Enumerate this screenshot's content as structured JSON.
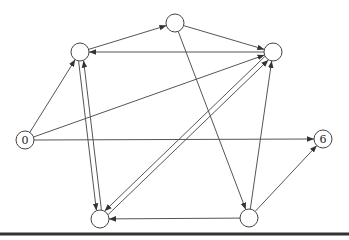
{
  "diagram": {
    "type": "directed-graph",
    "nodes": [
      {
        "id": "n0",
        "label": "0",
        "x": 25,
        "y": 140
      },
      {
        "id": "nL",
        "label": "",
        "x": 80,
        "y": 52
      },
      {
        "id": "nT",
        "label": "",
        "x": 175,
        "y": 23
      },
      {
        "id": "nR",
        "label": "",
        "x": 273,
        "y": 52
      },
      {
        "id": "n6",
        "label": "6",
        "x": 323,
        "y": 139
      },
      {
        "id": "nBL",
        "label": "",
        "x": 100,
        "y": 219
      },
      {
        "id": "nBR",
        "label": "",
        "x": 249,
        "y": 218
      }
    ],
    "edges": [
      {
        "from": "n0",
        "to": "nL"
      },
      {
        "from": "n0",
        "to": "nR"
      },
      {
        "from": "n0",
        "to": "n6"
      },
      {
        "from": "nL",
        "to": "nT"
      },
      {
        "from": "nR",
        "to": "nL"
      },
      {
        "from": "nL",
        "to": "nBL"
      },
      {
        "from": "nBL",
        "to": "nL"
      },
      {
        "from": "nT",
        "to": "nR"
      },
      {
        "from": "nT",
        "to": "nBR"
      },
      {
        "from": "nBL",
        "to": "nR"
      },
      {
        "from": "nR",
        "to": "nBL"
      },
      {
        "from": "nBR",
        "to": "nR"
      },
      {
        "from": "nBR",
        "to": "nBL"
      },
      {
        "from": "nBR",
        "to": "n6"
      }
    ],
    "colors": {
      "stroke": "#555555",
      "node_fill": "#ffffff",
      "baseline": "#333333"
    }
  }
}
